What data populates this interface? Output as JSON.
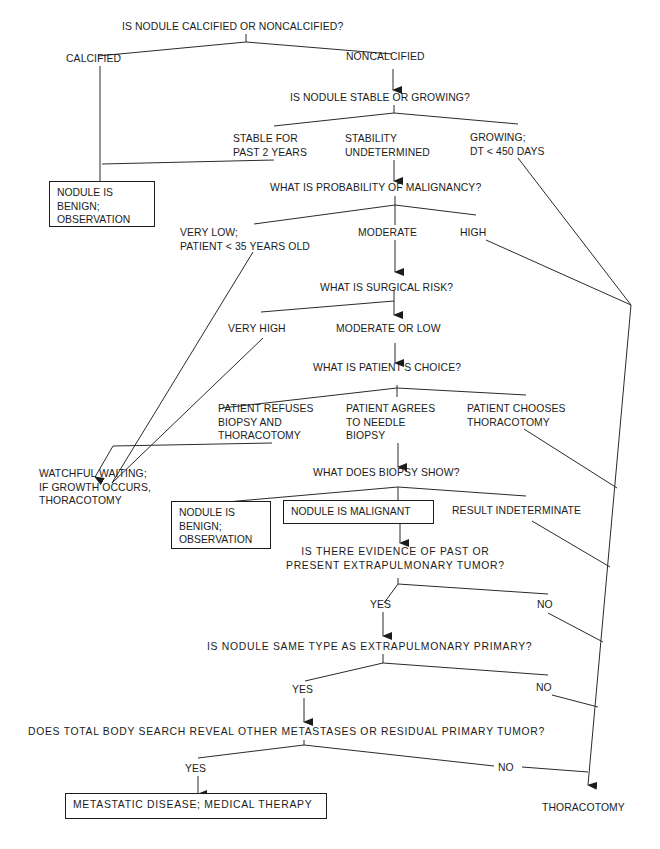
{
  "diagram": {
    "type": "decision-tree",
    "nodes": {
      "q_calcified": "IS NODULE CALCIFIED OR NONCALCIFIED?",
      "calcified": "CALCIFIED",
      "noncalcified": "NONCALCIFIED",
      "q_stable": "IS NODULE STABLE OR GROWING?",
      "stable": "STABLE FOR\nPAST 2 YEARS",
      "undetermined": "STABILITY\nUNDETERMINED",
      "growing": "GROWING;\nDT < 450 DAYS",
      "benign_1": "NODULE IS\nBENIGN;\nOBSERVATION",
      "q_probability": "WHAT IS PROBABILITY OF MALIGNANCY?",
      "very_low": "VERY LOW;\nPATIENT < 35 YEARS OLD",
      "moderate": "MODERATE",
      "high": "HIGH",
      "q_surgical": "WHAT IS SURGICAL RISK?",
      "very_high": "VERY HIGH",
      "mod_low": "MODERATE OR LOW",
      "q_choice": "WHAT IS PATIENT'S CHOICE?",
      "refuses": "PATIENT REFUSES\nBIOPSY AND\nTHORACOTOMY",
      "agrees": "PATIENT AGREES\nTO NEEDLE\nBIOPSY",
      "chooses": "PATIENT CHOOSES\nTHORACOTOMY",
      "watchful": "WATCHFUL WAITING;\nIF GROWTH OCCURS,\nTHORACOTOMY",
      "q_biopsy": "WHAT DOES BIOPSY SHOW?",
      "benign_2": "NODULE IS\nBENIGN;\nOBSERVATION",
      "malignant": "NODULE IS MALIGNANT",
      "indeterminate": "RESULT INDETERMINATE",
      "q_extrapulm": "IS THERE EVIDENCE OF PAST OR\nPRESENT EXTRAPULMONARY TUMOR?",
      "yes_1": "YES",
      "no_1": "NO",
      "q_same_type": "IS NODULE SAME TYPE AS EXTRAPULMONARY PRIMARY?",
      "yes_2": "YES",
      "no_2": "NO",
      "q_body_search": "DOES TOTAL BODY SEARCH REVEAL OTHER METASTASES OR RESIDUAL PRIMARY TUMOR?",
      "yes_3": "YES",
      "no_3": "NO",
      "metastatic": "METASTATIC DISEASE; MEDICAL THERAPY",
      "thoracotomy": "THORACOTOMY"
    },
    "edges": [
      [
        "q_calcified",
        "calcified"
      ],
      [
        "q_calcified",
        "noncalcified"
      ],
      [
        "calcified",
        "benign_1"
      ],
      [
        "noncalcified",
        "q_stable"
      ],
      [
        "q_stable",
        "stable"
      ],
      [
        "q_stable",
        "undetermined"
      ],
      [
        "q_stable",
        "growing"
      ],
      [
        "stable",
        "benign_1"
      ],
      [
        "undetermined",
        "q_probability"
      ],
      [
        "growing",
        "thoracotomy"
      ],
      [
        "q_probability",
        "very_low"
      ],
      [
        "q_probability",
        "moderate"
      ],
      [
        "q_probability",
        "high"
      ],
      [
        "very_low",
        "watchful"
      ],
      [
        "moderate",
        "q_surgical"
      ],
      [
        "high",
        "thoracotomy"
      ],
      [
        "q_surgical",
        "very_high"
      ],
      [
        "q_surgical",
        "mod_low"
      ],
      [
        "very_high",
        "watchful"
      ],
      [
        "mod_low",
        "q_choice"
      ],
      [
        "q_choice",
        "refuses"
      ],
      [
        "q_choice",
        "agrees"
      ],
      [
        "q_choice",
        "chooses"
      ],
      [
        "refuses",
        "watchful"
      ],
      [
        "agrees",
        "q_biopsy"
      ],
      [
        "chooses",
        "thoracotomy"
      ],
      [
        "q_biopsy",
        "benign_2"
      ],
      [
        "q_biopsy",
        "malignant"
      ],
      [
        "q_biopsy",
        "indeterminate"
      ],
      [
        "indeterminate",
        "thoracotomy"
      ],
      [
        "malignant",
        "q_extrapulm"
      ],
      [
        "q_extrapulm",
        "yes_1"
      ],
      [
        "q_extrapulm",
        "no_1"
      ],
      [
        "yes_1",
        "q_same_type"
      ],
      [
        "no_1",
        "thoracotomy"
      ],
      [
        "q_same_type",
        "yes_2"
      ],
      [
        "q_same_type",
        "no_2"
      ],
      [
        "yes_2",
        "q_body_search"
      ],
      [
        "no_2",
        "thoracotomy"
      ],
      [
        "q_body_search",
        "yes_3"
      ],
      [
        "q_body_search",
        "no_3"
      ],
      [
        "yes_3",
        "metastatic"
      ],
      [
        "no_3",
        "thoracotomy"
      ]
    ],
    "colors": {
      "ink": "#1c1c1c",
      "background": "#ffffff"
    }
  }
}
